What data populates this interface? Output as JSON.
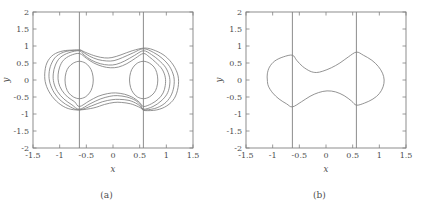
{
  "figure": {
    "background_color": "#ffffff",
    "line_color": "#808080",
    "text_color": "#4d4d4d"
  },
  "panels": [
    {
      "id": "panel-a",
      "caption": "(a)",
      "xlabel": "x",
      "ylabel": "y"
    },
    {
      "id": "panel-b",
      "caption": "(b)",
      "xlabel": "x",
      "ylabel": "y"
    }
  ],
  "axes": {
    "x_ticks": [
      "-1.5",
      "-1",
      "-0.5",
      "0",
      "0.5",
      "1",
      "1.5"
    ],
    "y_ticks": [
      "2",
      "1.5",
      "1",
      "0.5",
      "0",
      "-0.5",
      "-1",
      "-1.5",
      "-2"
    ]
  },
  "chart_data": [
    {
      "type": "line",
      "title": "(a)",
      "xlabel": "x",
      "ylabel": "y",
      "xlim": [
        -1.5,
        1.5
      ],
      "ylim": [
        -2,
        2
      ],
      "xticks": [
        -1.5,
        -1,
        -0.5,
        0,
        0.5,
        1,
        1.5
      ],
      "yticks": [
        2,
        1.5,
        1,
        0.5,
        0,
        -0.5,
        -1,
        -1.5,
        -2
      ],
      "grid": false,
      "legend": "none",
      "annotations": [
        {
          "kind": "vertical-line",
          "x": -0.63,
          "y_from": -2,
          "y_to": 2
        },
        {
          "kind": "vertical-line",
          "x": 0.57,
          "y_from": -2,
          "y_to": 2
        }
      ],
      "series": [
        {
          "name": "inner-oval-left",
          "closed": true,
          "points": [
            [
              -0.63,
              0.55
            ],
            [
              -0.74,
              0.5
            ],
            [
              -0.83,
              0.38
            ],
            [
              -0.88,
              0.22
            ],
            [
              -0.9,
              0.0
            ],
            [
              -0.88,
              -0.22
            ],
            [
              -0.83,
              -0.38
            ],
            [
              -0.74,
              -0.5
            ],
            [
              -0.63,
              -0.55
            ],
            [
              -0.52,
              -0.5
            ],
            [
              -0.44,
              -0.38
            ],
            [
              -0.39,
              -0.22
            ],
            [
              -0.37,
              0.0
            ],
            [
              -0.39,
              0.22
            ],
            [
              -0.44,
              0.38
            ],
            [
              -0.52,
              0.5
            ]
          ]
        },
        {
          "name": "inner-oval-right",
          "closed": true,
          "points": [
            [
              0.57,
              0.55
            ],
            [
              0.68,
              0.5
            ],
            [
              0.77,
              0.38
            ],
            [
              0.82,
              0.22
            ],
            [
              0.84,
              0.0
            ],
            [
              0.82,
              -0.22
            ],
            [
              0.77,
              -0.38
            ],
            [
              0.68,
              -0.5
            ],
            [
              0.57,
              -0.55
            ],
            [
              0.46,
              -0.5
            ],
            [
              0.38,
              -0.38
            ],
            [
              0.33,
              -0.22
            ],
            [
              0.31,
              0.0
            ],
            [
              0.33,
              0.22
            ],
            [
              0.38,
              0.38
            ],
            [
              0.46,
              0.5
            ]
          ]
        },
        {
          "name": "contour-level-1",
          "closed": true,
          "points": [
            [
              -0.63,
              0.78
            ],
            [
              -0.8,
              0.72
            ],
            [
              -0.93,
              0.58
            ],
            [
              -1.0,
              0.38
            ],
            [
              -1.03,
              0.15
            ],
            [
              -1.02,
              -0.08
            ],
            [
              -0.96,
              -0.3
            ],
            [
              -0.85,
              -0.5
            ],
            [
              -0.72,
              -0.64
            ],
            [
              -0.63,
              -0.78
            ],
            [
              -0.45,
              -0.62
            ],
            [
              -0.28,
              -0.48
            ],
            [
              -0.1,
              -0.4
            ],
            [
              0.05,
              -0.38
            ],
            [
              0.22,
              -0.42
            ],
            [
              0.38,
              -0.52
            ],
            [
              0.5,
              -0.66
            ],
            [
              0.57,
              -0.78
            ],
            [
              0.72,
              -0.7
            ],
            [
              0.85,
              -0.56
            ],
            [
              0.94,
              -0.38
            ],
            [
              0.98,
              -0.16
            ],
            [
              0.98,
              0.08
            ],
            [
              0.92,
              0.32
            ],
            [
              0.8,
              0.52
            ],
            [
              0.68,
              0.68
            ],
            [
              0.57,
              0.78
            ],
            [
              0.42,
              0.64
            ],
            [
              0.26,
              0.48
            ],
            [
              0.1,
              0.38
            ],
            [
              -0.05,
              0.36
            ],
            [
              -0.2,
              0.4
            ],
            [
              -0.36,
              0.5
            ],
            [
              -0.5,
              0.64
            ]
          ]
        },
        {
          "name": "contour-level-2",
          "closed": true,
          "points": [
            [
              -0.63,
              0.86
            ],
            [
              -0.83,
              0.8
            ],
            [
              -0.99,
              0.66
            ],
            [
              -1.08,
              0.44
            ],
            [
              -1.12,
              0.18
            ],
            [
              -1.11,
              -0.08
            ],
            [
              -1.04,
              -0.34
            ],
            [
              -0.92,
              -0.56
            ],
            [
              -0.77,
              -0.73
            ],
            [
              -0.63,
              -0.86
            ],
            [
              -0.43,
              -0.7
            ],
            [
              -0.24,
              -0.56
            ],
            [
              -0.06,
              -0.48
            ],
            [
              0.08,
              -0.46
            ],
            [
              0.26,
              -0.5
            ],
            [
              0.42,
              -0.6
            ],
            [
              0.52,
              -0.74
            ],
            [
              0.57,
              -0.86
            ],
            [
              0.75,
              -0.78
            ],
            [
              0.9,
              -0.62
            ],
            [
              1.01,
              -0.42
            ],
            [
              1.06,
              -0.18
            ],
            [
              1.06,
              0.08
            ],
            [
              0.99,
              0.36
            ],
            [
              0.86,
              0.58
            ],
            [
              0.72,
              0.75
            ],
            [
              0.57,
              0.86
            ],
            [
              0.4,
              0.72
            ],
            [
              0.22,
              0.56
            ],
            [
              0.06,
              0.46
            ],
            [
              -0.08,
              0.44
            ],
            [
              -0.24,
              0.48
            ],
            [
              -0.4,
              0.58
            ],
            [
              -0.54,
              0.73
            ]
          ]
        },
        {
          "name": "contour-level-3",
          "closed": true,
          "points": [
            [
              -0.63,
              0.88
            ],
            [
              -0.88,
              0.84
            ],
            [
              -1.06,
              0.7
            ],
            [
              -1.16,
              0.46
            ],
            [
              -1.2,
              0.18
            ],
            [
              -1.18,
              -0.1
            ],
            [
              -1.1,
              -0.38
            ],
            [
              -0.97,
              -0.62
            ],
            [
              -0.8,
              -0.79
            ],
            [
              -0.63,
              -0.88
            ],
            [
              -0.4,
              -0.76
            ],
            [
              -0.2,
              -0.64
            ],
            [
              -0.02,
              -0.58
            ],
            [
              0.12,
              -0.57
            ],
            [
              0.3,
              -0.6
            ],
            [
              0.45,
              -0.7
            ],
            [
              0.54,
              -0.82
            ],
            [
              0.57,
              -0.88
            ],
            [
              0.78,
              -0.84
            ],
            [
              0.96,
              -0.7
            ],
            [
              1.08,
              -0.48
            ],
            [
              1.14,
              -0.2
            ],
            [
              1.14,
              0.1
            ],
            [
              1.06,
              0.4
            ],
            [
              0.92,
              0.64
            ],
            [
              0.76,
              0.81
            ],
            [
              0.57,
              0.92
            ],
            [
              0.38,
              0.8
            ],
            [
              0.18,
              0.66
            ],
            [
              0.02,
              0.57
            ],
            [
              -0.12,
              0.56
            ],
            [
              -0.28,
              0.6
            ],
            [
              -0.44,
              0.7
            ],
            [
              -0.56,
              0.82
            ]
          ]
        },
        {
          "name": "contour-level-4",
          "closed": true,
          "points": [
            [
              -0.63,
              0.88
            ],
            [
              -0.92,
              0.86
            ],
            [
              -1.12,
              0.74
            ],
            [
              -1.24,
              0.5
            ],
            [
              -1.28,
              0.18
            ],
            [
              -1.26,
              -0.12
            ],
            [
              -1.17,
              -0.42
            ],
            [
              -1.02,
              -0.68
            ],
            [
              -0.84,
              -0.84
            ],
            [
              -0.63,
              -0.88
            ],
            [
              -0.36,
              -0.82
            ],
            [
              -0.16,
              -0.72
            ],
            [
              0.02,
              -0.66
            ],
            [
              0.16,
              -0.66
            ],
            [
              0.33,
              -0.7
            ],
            [
              0.48,
              -0.79
            ],
            [
              0.56,
              -0.86
            ],
            [
              0.6,
              -0.9
            ],
            [
              0.82,
              -0.88
            ],
            [
              1.01,
              -0.76
            ],
            [
              1.15,
              -0.54
            ],
            [
              1.22,
              -0.22
            ],
            [
              1.22,
              0.12
            ],
            [
              1.13,
              0.44
            ],
            [
              0.98,
              0.7
            ],
            [
              0.8,
              0.86
            ],
            [
              0.6,
              0.94
            ],
            [
              0.36,
              0.86
            ],
            [
              0.15,
              0.74
            ],
            [
              -0.02,
              0.66
            ],
            [
              -0.16,
              0.65
            ],
            [
              -0.32,
              0.7
            ],
            [
              -0.48,
              0.79
            ],
            [
              -0.58,
              0.86
            ]
          ]
        }
      ]
    },
    {
      "type": "line",
      "title": "(b)",
      "xlabel": "x",
      "ylabel": "y",
      "xlim": [
        -1.5,
        1.5
      ],
      "ylim": [
        -2,
        2
      ],
      "xticks": [
        -1.5,
        -1,
        -0.5,
        0,
        0.5,
        1,
        1.5
      ],
      "yticks": [
        2,
        1.5,
        1,
        0.5,
        0,
        -0.5,
        -1,
        -1.5,
        -2
      ],
      "grid": false,
      "legend": "none",
      "annotations": [
        {
          "kind": "vertical-line",
          "x": -0.63,
          "y_from": -2,
          "y_to": 2
        },
        {
          "kind": "vertical-line",
          "x": 0.57,
          "y_from": -2,
          "y_to": 2
        }
      ],
      "series": [
        {
          "name": "peanut-contour",
          "closed": true,
          "points": [
            [
              -0.63,
              0.73
            ],
            [
              -0.8,
              0.68
            ],
            [
              -0.96,
              0.56
            ],
            [
              -1.06,
              0.38
            ],
            [
              -1.1,
              0.18
            ],
            [
              -1.1,
              0.0
            ],
            [
              -1.08,
              -0.18
            ],
            [
              -1.0,
              -0.38
            ],
            [
              -0.88,
              -0.56
            ],
            [
              -0.74,
              -0.7
            ],
            [
              -0.63,
              -0.79
            ],
            [
              -0.46,
              -0.64
            ],
            [
              -0.3,
              -0.48
            ],
            [
              -0.14,
              -0.37
            ],
            [
              0.02,
              -0.32
            ],
            [
              0.18,
              -0.35
            ],
            [
              0.34,
              -0.46
            ],
            [
              0.48,
              -0.62
            ],
            [
              0.57,
              -0.74
            ],
            [
              0.72,
              -0.68
            ],
            [
              0.88,
              -0.56
            ],
            [
              1.0,
              -0.4
            ],
            [
              1.07,
              -0.2
            ],
            [
              1.09,
              0.0
            ],
            [
              1.06,
              0.2
            ],
            [
              0.98,
              0.4
            ],
            [
              0.86,
              0.58
            ],
            [
              0.7,
              0.73
            ],
            [
              0.57,
              0.82
            ],
            [
              0.42,
              0.68
            ],
            [
              0.26,
              0.5
            ],
            [
              0.1,
              0.36
            ],
            [
              -0.06,
              0.26
            ],
            [
              -0.18,
              0.22
            ],
            [
              -0.3,
              0.26
            ],
            [
              -0.44,
              0.4
            ],
            [
              -0.55,
              0.58
            ]
          ]
        }
      ]
    }
  ]
}
